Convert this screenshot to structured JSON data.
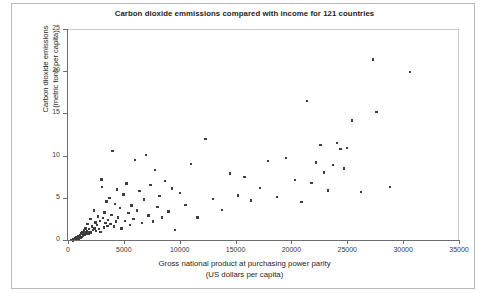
{
  "chart_data": {
    "type": "scatter",
    "title": "Carbon dioxide emmissions compared with income for 121 countries",
    "xlabel_line1": "Gross national product at purchasing power parity",
    "xlabel_line2": "(US dollars per capita)",
    "ylabel_line1": "Carbon dioxide emissions",
    "ylabel_line2": "(metric tons per capita)",
    "xlim": [
      0,
      35000
    ],
    "ylim": [
      0,
      25
    ],
    "xticks": [
      0,
      5000,
      10000,
      15000,
      20000,
      25000,
      30000,
      35000
    ],
    "yticks": [
      0,
      5,
      10,
      15,
      20,
      25
    ],
    "xtick_labels": [
      "0",
      "5000",
      "10000",
      "15000",
      "20000",
      "25000",
      "30000",
      "35000"
    ],
    "ytick_labels": [
      "0",
      "5",
      "10",
      "15",
      "20",
      "25"
    ],
    "grid": false,
    "legend": false,
    "n_points": 121,
    "marker_color": "#3d3d3d",
    "axis_color": "#6d6d6d",
    "frame_color": "#c9c9c9",
    "background": "#ffffff",
    "series": [
      {
        "name": "countries",
        "points": [
          [
            320,
            0.1
          ],
          [
            400,
            0.15
          ],
          [
            450,
            0.05
          ],
          [
            500,
            0.2
          ],
          [
            560,
            0.1
          ],
          [
            600,
            0.3
          ],
          [
            640,
            0.12
          ],
          [
            700,
            0.25
          ],
          [
            740,
            0.4
          ],
          [
            780,
            0.2
          ],
          [
            820,
            0.35
          ],
          [
            860,
            0.5
          ],
          [
            900,
            0.3
          ],
          [
            940,
            0.6
          ],
          [
            980,
            0.25
          ],
          [
            1020,
            0.45
          ],
          [
            1080,
            0.7
          ],
          [
            1120,
            0.35
          ],
          [
            1180,
            0.9
          ],
          [
            1220,
            0.5
          ],
          [
            1280,
            1.1
          ],
          [
            1320,
            0.6
          ],
          [
            1380,
            0.8
          ],
          [
            1420,
            1.3
          ],
          [
            1480,
            0.7
          ],
          [
            1520,
            1.0
          ],
          [
            1580,
            1.5
          ],
          [
            1640,
            0.9
          ],
          [
            1700,
            1.2
          ],
          [
            1760,
            2.0
          ],
          [
            1820,
            0.8
          ],
          [
            1880,
            1.4
          ],
          [
            1940,
            1.1
          ],
          [
            2000,
            2.6
          ],
          [
            2080,
            1.0
          ],
          [
            2150,
            1.7
          ],
          [
            2220,
            1.3
          ],
          [
            2300,
            3.6
          ],
          [
            2380,
            1.5
          ],
          [
            2450,
            2.2
          ],
          [
            2520,
            1.2
          ],
          [
            2600,
            1.9
          ],
          [
            2680,
            2.9
          ],
          [
            2760,
            1.4
          ],
          [
            2840,
            2.4
          ],
          [
            2920,
            1.1
          ],
          [
            3000,
            7.3
          ],
          [
            3060,
            6.4
          ],
          [
            3120,
            2.7
          ],
          [
            3200,
            1.6
          ],
          [
            3280,
            3.4
          ],
          [
            3360,
            2.1
          ],
          [
            3440,
            4.7
          ],
          [
            3520,
            1.8
          ],
          [
            3600,
            2.5
          ],
          [
            3700,
            5.1
          ],
          [
            3800,
            2.0
          ],
          [
            3900,
            3.1
          ],
          [
            4000,
            10.7
          ],
          [
            4100,
            1.7
          ],
          [
            4200,
            4.4
          ],
          [
            4300,
            2.3
          ],
          [
            4400,
            6.1
          ],
          [
            4500,
            2.8
          ],
          [
            4650,
            3.9
          ],
          [
            4800,
            1.5
          ],
          [
            4950,
            5.5
          ],
          [
            5100,
            2.4
          ],
          [
            5250,
            6.8
          ],
          [
            5400,
            3.3
          ],
          [
            5550,
            1.9
          ],
          [
            5700,
            4.2
          ],
          [
            5850,
            2.6
          ],
          [
            6000,
            9.6
          ],
          [
            6200,
            3.6
          ],
          [
            6400,
            5.9
          ],
          [
            6600,
            2.1
          ],
          [
            6800,
            4.9
          ],
          [
            7000,
            10.2
          ],
          [
            7200,
            3.0
          ],
          [
            7400,
            6.6
          ],
          [
            7600,
            2.3
          ],
          [
            7800,
            8.4
          ],
          [
            8000,
            4.0
          ],
          [
            8200,
            5.3
          ],
          [
            8400,
            2.8
          ],
          [
            8700,
            7.1
          ],
          [
            9000,
            3.5
          ],
          [
            9300,
            6.2
          ],
          [
            9600,
            1.3
          ],
          [
            10000,
            5.7
          ],
          [
            10500,
            4.3
          ],
          [
            11000,
            9.1
          ],
          [
            11600,
            2.8
          ],
          [
            12300,
            12.1
          ],
          [
            13000,
            5.0
          ],
          [
            13800,
            3.7
          ],
          [
            14500,
            8.0
          ],
          [
            15200,
            5.4
          ],
          [
            15800,
            7.6
          ],
          [
            16400,
            4.8
          ],
          [
            17200,
            6.3
          ],
          [
            17900,
            9.5
          ],
          [
            18700,
            5.2
          ],
          [
            19500,
            9.8
          ],
          [
            20300,
            7.2
          ],
          [
            20900,
            4.6
          ],
          [
            21400,
            16.6
          ],
          [
            21800,
            6.9
          ],
          [
            22200,
            9.3
          ],
          [
            22600,
            11.4
          ],
          [
            22900,
            8.1
          ],
          [
            23300,
            6.0
          ],
          [
            23700,
            9.0
          ],
          [
            24100,
            11.6
          ],
          [
            24400,
            10.9
          ],
          [
            24700,
            8.6
          ],
          [
            25000,
            11.0
          ],
          [
            25400,
            14.3
          ],
          [
            26200,
            5.8
          ],
          [
            27300,
            21.5
          ],
          [
            27600,
            15.3
          ],
          [
            28800,
            6.4
          ],
          [
            30600,
            20.0
          ]
        ]
      }
    ]
  }
}
